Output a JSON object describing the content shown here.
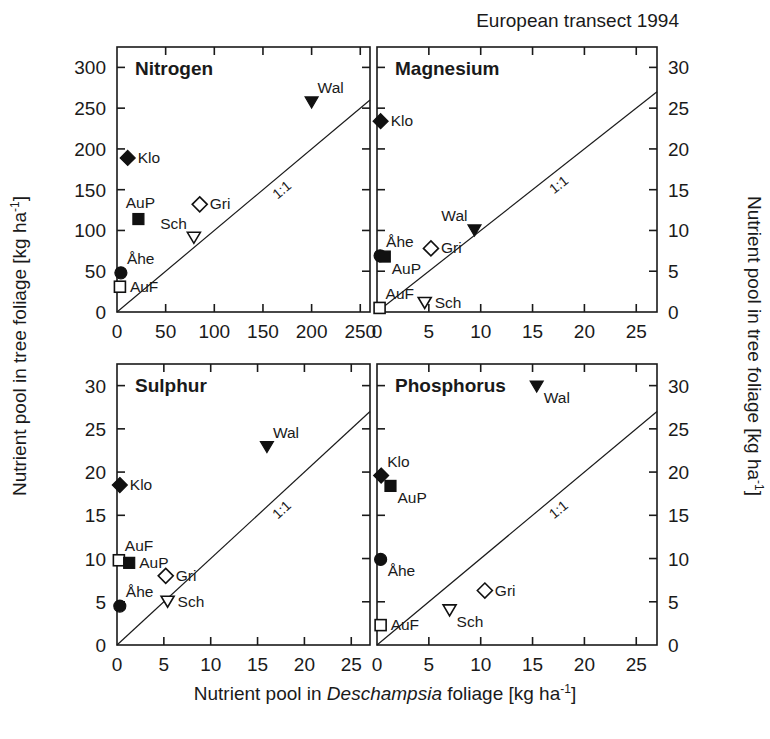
{
  "header": {
    "caption": "European transect 1994"
  },
  "axes": {
    "x_title_pre": "Nutrient pool in ",
    "x_title_italic": "Deschampsia",
    "x_title_post": " foliage [kg ha",
    "x_title_sup": "-1",
    "x_title_end": "]",
    "y_title_pre": "Nutrient pool in tree foliage [kg ha",
    "y_title_sup": "-1",
    "y_title_end": "]"
  },
  "ratio_line_label": "1:1",
  "chart_data": [
    {
      "type": "scatter",
      "title": "Nitrogen",
      "panel": "top-left",
      "xlabel": "Nutrient pool in Deschampsia foliage [kg ha-1]",
      "ylabel": "Nutrient pool in tree foliage [kg ha-1]",
      "xlim": [
        0,
        260
      ],
      "ylim": [
        0,
        325
      ],
      "xticks": [
        0,
        50,
        100,
        150,
        200,
        250
      ],
      "yticks": [
        0,
        50,
        100,
        150,
        200,
        250,
        300
      ],
      "grid": false,
      "reference_line": "1:1",
      "points": [
        {
          "name": "Klo",
          "x": 11,
          "y": 189,
          "marker": "filled-diamond",
          "label_pos": "right"
        },
        {
          "name": "AuP",
          "x": 22,
          "y": 114,
          "marker": "filled-square",
          "label_pos": "above"
        },
        {
          "name": "Gri",
          "x": 85,
          "y": 132,
          "marker": "open-diamond",
          "label_pos": "right"
        },
        {
          "name": "Sch",
          "x": 79,
          "y": 91,
          "marker": "open-triangle-down",
          "label_pos": "above-left"
        },
        {
          "name": "Åhe",
          "x": 4,
          "y": 48,
          "marker": "filled-circle",
          "label_pos": "above-right"
        },
        {
          "name": "AuF",
          "x": 3,
          "y": 31,
          "marker": "open-square",
          "label_pos": "right"
        },
        {
          "name": "Wal",
          "x": 200,
          "y": 257,
          "marker": "filled-triangle-down",
          "label_pos": "above-right"
        }
      ]
    },
    {
      "type": "scatter",
      "title": "Magnesium",
      "panel": "top-right",
      "xlabel": "Nutrient pool in Deschampsia foliage [kg ha-1]",
      "ylabel": "Nutrient pool in tree foliage [kg ha-1]",
      "xlim": [
        0,
        27
      ],
      "ylim": [
        0,
        32.5
      ],
      "xticks": [
        0,
        5,
        10,
        15,
        20,
        25
      ],
      "yticks": [
        0,
        5,
        10,
        15,
        20,
        25,
        30
      ],
      "grid": false,
      "reference_line": "1:1",
      "points": [
        {
          "name": "Klo",
          "x": 0.35,
          "y": 23.4,
          "marker": "filled-diamond",
          "label_pos": "right"
        },
        {
          "name": "Åhe",
          "x": 0.3,
          "y": 6.9,
          "marker": "filled-circle",
          "label_pos": "above-right"
        },
        {
          "name": "AuP",
          "x": 0.75,
          "y": 6.8,
          "marker": "filled-square",
          "label_pos": "below-right"
        },
        {
          "name": "Gri",
          "x": 5.2,
          "y": 7.8,
          "marker": "open-diamond",
          "label_pos": "right"
        },
        {
          "name": "Wal",
          "x": 9.4,
          "y": 10.0,
          "marker": "filled-triangle-down",
          "label_pos": "above-left"
        },
        {
          "name": "AuF",
          "x": 0.25,
          "y": 0.5,
          "marker": "open-square",
          "label_pos": "above-right"
        },
        {
          "name": "Sch",
          "x": 4.6,
          "y": 1.1,
          "marker": "open-triangle-down",
          "label_pos": "right"
        }
      ]
    },
    {
      "type": "scatter",
      "title": "Sulphur",
      "panel": "bottom-left",
      "xlabel": "Nutrient pool in Deschampsia foliage [kg ha-1]",
      "ylabel": "Nutrient pool in tree foliage [kg ha-1]",
      "xlim": [
        0,
        27
      ],
      "ylim": [
        0,
        32.5
      ],
      "xticks": [
        0,
        5,
        10,
        15,
        20,
        25
      ],
      "yticks": [
        0,
        5,
        10,
        15,
        20,
        25,
        30
      ],
      "grid": false,
      "reference_line": "1:1",
      "points": [
        {
          "name": "Klo",
          "x": 0.3,
          "y": 18.5,
          "marker": "filled-diamond",
          "label_pos": "right"
        },
        {
          "name": "AuF",
          "x": 0.2,
          "y": 9.8,
          "marker": "open-square",
          "label_pos": "above-right"
        },
        {
          "name": "AuP",
          "x": 1.3,
          "y": 9.5,
          "marker": "filled-square",
          "label_pos": "right"
        },
        {
          "name": "Gri",
          "x": 5.2,
          "y": 8.0,
          "marker": "open-diamond",
          "label_pos": "right"
        },
        {
          "name": "Åhe",
          "x": 0.3,
          "y": 4.5,
          "marker": "filled-circle",
          "label_pos": "above-right"
        },
        {
          "name": "Sch",
          "x": 5.4,
          "y": 5.0,
          "marker": "open-triangle-down",
          "label_pos": "right"
        },
        {
          "name": "Wal",
          "x": 16.0,
          "y": 22.9,
          "marker": "filled-triangle-down",
          "label_pos": "above-right"
        }
      ]
    },
    {
      "type": "scatter",
      "title": "Phosphorus",
      "panel": "bottom-right",
      "xlabel": "Nutrient pool in Deschampsia foliage [kg ha-1]",
      "ylabel": "Nutrient pool in tree foliage [kg ha-1]",
      "xlim": [
        0,
        27
      ],
      "ylim": [
        0,
        32.5
      ],
      "xticks": [
        0,
        5,
        10,
        15,
        20,
        25
      ],
      "yticks": [
        0,
        5,
        10,
        15,
        20,
        25,
        30
      ],
      "grid": false,
      "reference_line": "1:1",
      "points": [
        {
          "name": "Wal",
          "x": 15.4,
          "y": 29.9,
          "marker": "filled-triangle-down",
          "label_pos": "below-right"
        },
        {
          "name": "Klo",
          "x": 0.4,
          "y": 19.6,
          "marker": "filled-diamond",
          "label_pos": "above-right"
        },
        {
          "name": "AuP",
          "x": 1.3,
          "y": 18.4,
          "marker": "filled-square",
          "label_pos": "below-right"
        },
        {
          "name": "Åhe",
          "x": 0.35,
          "y": 9.9,
          "marker": "filled-circle",
          "label_pos": "below-right"
        },
        {
          "name": "Gri",
          "x": 10.4,
          "y": 6.3,
          "marker": "open-diamond",
          "label_pos": "right"
        },
        {
          "name": "Sch",
          "x": 7.0,
          "y": 4.0,
          "marker": "open-triangle-down",
          "label_pos": "below-right"
        },
        {
          "name": "AuF",
          "x": 0.35,
          "y": 2.3,
          "marker": "open-square",
          "label_pos": "right"
        }
      ]
    }
  ],
  "layout": {
    "panels": [
      {
        "key": "nitrogen",
        "left": 117,
        "top": 47,
        "width": 253,
        "height": 265,
        "yaxis": "left",
        "xaxis": "top-row"
      },
      {
        "key": "magnesium",
        "left": 377,
        "top": 47,
        "width": 280,
        "height": 265,
        "yaxis": "right",
        "xaxis": "top-row"
      },
      {
        "key": "sulphur",
        "left": 117,
        "top": 364,
        "width": 253,
        "height": 281,
        "yaxis": "left",
        "xaxis": "bottom-row"
      },
      {
        "key": "phosphorus",
        "left": 377,
        "top": 364,
        "width": 280,
        "height": 281,
        "yaxis": "right",
        "xaxis": "bottom-row"
      }
    ]
  }
}
